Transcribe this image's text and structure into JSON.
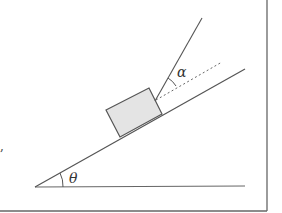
{
  "diagram": {
    "labels": {
      "incline_angle": "θ",
      "rope_angle": "α",
      "stray_mark": ","
    },
    "colors": {
      "line": "#555555",
      "block_fill": "#e4e4e4",
      "border": "#666666"
    }
  }
}
